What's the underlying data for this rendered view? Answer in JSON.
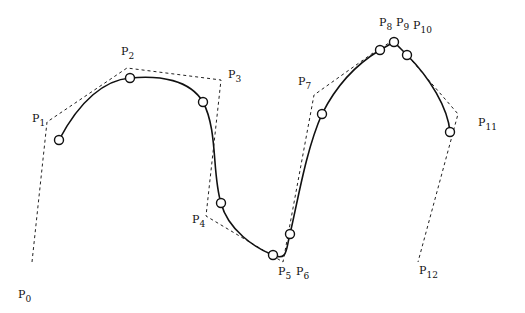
{
  "diagram": {
    "type": "B-spline curve with control polygon",
    "control_points": [
      {
        "label": "P",
        "index": "0",
        "x": 32,
        "y": 262,
        "lx": 18,
        "ly": 298
      },
      {
        "label": "P",
        "index": "1",
        "x": 47,
        "y": 122,
        "lx": 32,
        "ly": 122
      },
      {
        "label": "P",
        "index": "2",
        "x": 127,
        "y": 68,
        "lx": 121,
        "ly": 55
      },
      {
        "label": "P",
        "index": "3",
        "x": 221,
        "y": 80,
        "lx": 228,
        "ly": 78
      },
      {
        "label": "P",
        "index": "4",
        "x": 206,
        "y": 216,
        "lx": 192,
        "ly": 223
      },
      {
        "label": "P",
        "index": "5",
        "x": 283,
        "y": 262,
        "lx": 278,
        "ly": 275
      },
      {
        "label": "P",
        "index": "6",
        "x": 283,
        "y": 262,
        "lx": 296,
        "ly": 275
      },
      {
        "label": "P",
        "index": "7",
        "x": 314,
        "y": 95,
        "lx": 298,
        "ly": 85
      },
      {
        "label": "P",
        "index": "8",
        "x": 380,
        "y": 48,
        "lx": 379,
        "ly": 26
      },
      {
        "label": "P",
        "index": "9",
        "x": 393,
        "y": 41,
        "lx": 396,
        "ly": 26
      },
      {
        "label": "P",
        "index": "10",
        "x": 407,
        "y": 55,
        "lx": 413,
        "ly": 29
      },
      {
        "label": "P",
        "index": "11",
        "x": 458,
        "y": 114,
        "lx": 478,
        "ly": 126
      },
      {
        "label": "P",
        "index": "12",
        "x": 418,
        "y": 262,
        "lx": 419,
        "ly": 274
      }
    ],
    "knot_points": [
      {
        "x": 59,
        "y": 140
      },
      {
        "x": 130,
        "y": 78
      },
      {
        "x": 203,
        "y": 102
      },
      {
        "x": 221,
        "y": 203
      },
      {
        "x": 273,
        "y": 255
      },
      {
        "x": 290,
        "y": 234
      },
      {
        "x": 322,
        "y": 114
      },
      {
        "x": 380,
        "y": 50
      },
      {
        "x": 394,
        "y": 42
      },
      {
        "x": 407,
        "y": 55
      },
      {
        "x": 450,
        "y": 132
      }
    ],
    "curve_path": "M59,140 C80,100 105,80 130,78 C160,75 190,80 203,102 C218,130 212,175 221,203 C228,230 255,248 273,255 C288,262 286,248 290,234 C298,200 306,150 322,114 C338,82 360,62 380,50 L394,42 L407,55 C430,78 448,108 450,132",
    "polygon_color": "#222222",
    "curve_color": "#111111"
  }
}
